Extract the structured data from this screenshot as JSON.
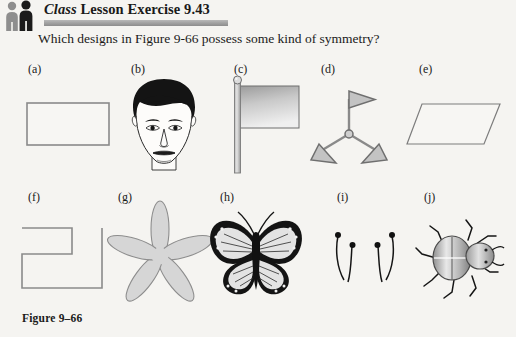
{
  "header": {
    "icon": "two-people-icon",
    "title_italic": "Class",
    "title_rest": " Lesson Exercise 9.43",
    "title_full": "Class Lesson Exercise 9.43",
    "rule_color": "#a2a2a2"
  },
  "question": {
    "text": "Which designs in Figure 9-66 possess some kind of symmetry?"
  },
  "figure": {
    "caption": "Figure 9–66",
    "rows": [
      {
        "items": [
          {
            "label": "(a)",
            "icon": "rectangle-outline",
            "label_x": 28,
            "label_y": 62,
            "fig_x": 26,
            "fig_y": 102,
            "fig_w": 86,
            "fig_h": 48
          },
          {
            "label": "(b)",
            "icon": "mans-face",
            "label_x": 131,
            "label_y": 62,
            "fig_x": 118,
            "fig_y": 78,
            "fig_w": 92,
            "fig_h": 92
          },
          {
            "label": "(c)",
            "icon": "flag-on-pole",
            "label_x": 234,
            "label_y": 62,
            "fig_x": 228,
            "fig_y": 76,
            "fig_w": 74,
            "fig_h": 96
          },
          {
            "label": "(d)",
            "icon": "three-arm-pinwheel",
            "label_x": 321,
            "label_y": 62,
            "fig_x": 305,
            "fig_y": 86,
            "fig_w": 88,
            "fig_h": 80
          },
          {
            "label": "(e)",
            "icon": "parallelogram-outline",
            "label_x": 419,
            "label_y": 62,
            "fig_x": 408,
            "fig_y": 102,
            "fig_w": 96,
            "fig_h": 48
          }
        ]
      },
      {
        "items": [
          {
            "label": "(f)",
            "icon": "open-zigzag-polygon",
            "label_x": 28,
            "label_y": 190,
            "fig_x": 16,
            "fig_y": 226,
            "fig_w": 92,
            "fig_h": 64
          },
          {
            "label": "(g)",
            "icon": "five-petal-flower",
            "label_x": 118,
            "label_y": 190,
            "fig_x": 112,
            "fig_y": 208,
            "fig_w": 96,
            "fig_h": 92
          },
          {
            "label": "(h)",
            "icon": "butterfly",
            "label_x": 220,
            "label_y": 190,
            "fig_x": 204,
            "fig_y": 206,
            "fig_w": 104,
            "fig_h": 94
          },
          {
            "label": "(i)",
            "icon": "paired-antennae",
            "label_x": 337,
            "label_y": 190,
            "fig_x": 326,
            "fig_y": 224,
            "fig_w": 78,
            "fig_h": 68
          },
          {
            "label": "(j)",
            "icon": "beetle",
            "label_x": 424,
            "label_y": 190,
            "fig_x": 416,
            "fig_y": 216,
            "fig_w": 90,
            "fig_h": 82
          }
        ]
      }
    ]
  },
  "colors": {
    "page_background": "#f5f4f1",
    "ink": "#1a1a1a",
    "outline_gray": "#8a8a8a",
    "fill_light_gray": "#d8d8d8",
    "fill_mid_gray": "#b0b0b0",
    "header_band": "#a2a2a2"
  }
}
